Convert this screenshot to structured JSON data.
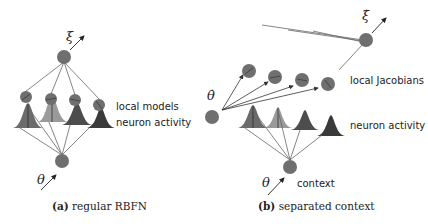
{
  "figure": {
    "panel_a": {
      "caption_label": "(a)",
      "caption_text": "regular RBFN",
      "input_symbol": "θ",
      "output_symbol": "ξ",
      "labels": {
        "local_models": "local models",
        "neuron_activity": "neuron activity"
      },
      "num_units": 4
    },
    "panel_b": {
      "caption_label": "(b)",
      "caption_text": "separated context",
      "input_symbol": "θ",
      "velocity_input_symbol": "θ̇",
      "output_symbol": "ξ̇",
      "labels": {
        "local_jacobians": "local Jacobians",
        "neuron_activity": "neuron activity",
        "context": "context"
      },
      "num_units": 4
    },
    "colors": {
      "node": "#6f6f6f",
      "edge": "#555555",
      "gaussian_shades": [
        "#6b6b6b",
        "#9a9a9a",
        "#4d4d4d",
        "#3a3a3a"
      ]
    }
  }
}
